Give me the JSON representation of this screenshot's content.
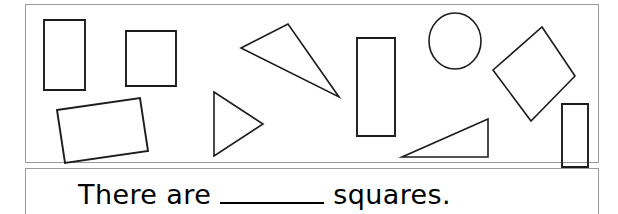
{
  "worksheet": {
    "type": "shape-counting-worksheet",
    "panels": {
      "shape_panel_label": "shape field",
      "question_panel_label": "answer sentence"
    },
    "question": {
      "text_before": "There are",
      "blank": "",
      "text_after": "squares.",
      "full_text": "There are _______ squares."
    },
    "colors": {
      "shape_stroke": "#1c1c1c",
      "panel_border": "#9a9a9a",
      "background": "#ffffff",
      "text": "#000000"
    },
    "shapes": [
      {
        "id": "rectangle-tall-left",
        "kind": "rectangle",
        "label": "vertical rectangle",
        "points": "44,20 85,20 85,90 44,90"
      },
      {
        "id": "square-upper-left",
        "kind": "square",
        "label": "square",
        "points": "126,31 176,31 176,86 126,86"
      },
      {
        "id": "rectangle-tilted-left",
        "kind": "rectangle",
        "label": "tilted rectangle",
        "points": "57,110 140,98 148,151 65,163"
      },
      {
        "id": "triangle-right-pointing",
        "kind": "triangle",
        "label": "right-pointing triangle",
        "points": "214,92 263,124 214,156"
      },
      {
        "id": "triangle-thin-slanted",
        "kind": "triangle",
        "label": "thin slanted triangle",
        "points": "241,48 288,24 339,97"
      },
      {
        "id": "rectangle-tall-center",
        "kind": "rectangle",
        "label": "tall vertical rectangle",
        "points": "357,38 395,38 395,136 357,136"
      },
      {
        "id": "circle-upper-right",
        "kind": "circle",
        "label": "circle",
        "cx": "455",
        "cy": "41",
        "rx": "26",
        "ry": "28"
      },
      {
        "id": "square-rotated-diamond",
        "kind": "square",
        "label": "rotated square",
        "points": "542,27 575,76 531,121 493,70"
      },
      {
        "id": "triangle-right-angle",
        "kind": "triangle",
        "label": "right triangle",
        "points": "402,157 488,157 488,119"
      },
      {
        "id": "rectangle-tall-right",
        "kind": "rectangle",
        "label": "vertical rectangle",
        "points": "562,104 588,104 588,167 562,167"
      }
    ]
  }
}
